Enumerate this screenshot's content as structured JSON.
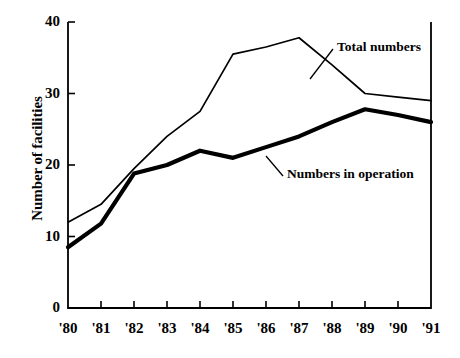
{
  "chart_data": {
    "type": "line",
    "title": "",
    "xlabel": "",
    "ylabel": "Number of facilities",
    "xlim": [
      1980,
      1991
    ],
    "ylim": [
      0,
      40
    ],
    "grid": false,
    "legend_position": "inline-annotations",
    "x": [
      1980,
      1981,
      1982,
      1983,
      1984,
      1985,
      1986,
      1987,
      1988,
      1989,
      1990,
      1991
    ],
    "categories": [
      "'80",
      "'81",
      "'82",
      "'83",
      "'84",
      "'85",
      "'86",
      "'87",
      "'88",
      "'89",
      "'90",
      "'91"
    ],
    "yticks": [
      0,
      10,
      20,
      30,
      40
    ],
    "ytick_labels": [
      "0",
      "10",
      "20",
      "30",
      "40"
    ],
    "series": [
      {
        "name": "Total numbers",
        "style": "thin",
        "color": "#000000",
        "values": [
          12,
          14.5,
          19.5,
          24,
          27.5,
          35.5,
          36.5,
          37.8,
          34,
          30,
          29.5,
          29
        ]
      },
      {
        "name": "Numbers in operation",
        "style": "thick",
        "color": "#000000",
        "values": [
          8.5,
          11.8,
          18.8,
          20,
          22,
          21,
          22.5,
          24,
          26,
          27.8,
          27,
          26
        ]
      }
    ],
    "annotations": [
      {
        "text": "Total numbers",
        "series": "Total numbers"
      },
      {
        "text": "Numbers in operation",
        "series": "Numbers in operation"
      }
    ]
  },
  "axes": {
    "y_title": "Number of facilities",
    "y_labels": [
      "40",
      "30",
      "20",
      "10",
      "0"
    ],
    "x_labels": [
      "'80",
      "'81",
      "'82",
      "'83",
      "'84",
      "'85",
      "'86",
      "'87",
      "'88",
      "'89",
      "'90",
      "'91"
    ]
  },
  "annotations": {
    "total": "Total numbers",
    "operation": "Numbers in operation"
  },
  "colors": {
    "line": "#000000",
    "axis": "#000000",
    "background": "#ffffff"
  }
}
